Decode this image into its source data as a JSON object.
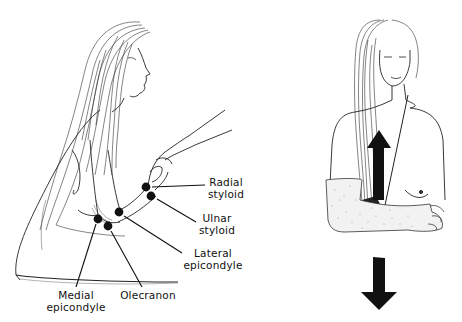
{
  "figure": {
    "left_panel": {
      "description": "Seated woman with long hair, examiner's hand holding her forearm; anatomical landmarks marked with black dots",
      "landmarks": [
        {
          "id": "radial-styloid",
          "line1": "Radial",
          "line2": "styloid"
        },
        {
          "id": "ulnar-styloid",
          "line1": "Ulnar",
          "line2": "styloid"
        },
        {
          "id": "lateral-epicondyle",
          "line1": "Lateral",
          "line2": "epicondyle"
        },
        {
          "id": "medial-epicondyle",
          "line1": "Medial",
          "line2": "epicondyle"
        },
        {
          "id": "olecranon",
          "line1": "Olecranon",
          "line2": ""
        }
      ]
    },
    "right_panel": {
      "description": "Frontal view of woman with forearm in cast; upward arrow on chest and downward arrow below"
    },
    "colors": {
      "ink": "#111111",
      "background": "#ffffff",
      "cast_stipple": "#888888"
    }
  }
}
